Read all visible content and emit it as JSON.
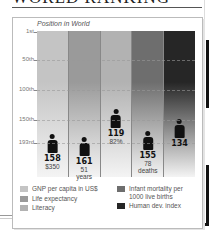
{
  "header": {
    "title": "WORLD RANKING"
  },
  "chart_data": {
    "type": "bar",
    "title": "Position in World",
    "xlabel": "",
    "ylabel": "Position in World",
    "y_ticks": [
      "1st",
      "50th",
      "100th",
      "150th",
      "193rd"
    ],
    "ylim": [
      1,
      193
    ],
    "y_inverted": true,
    "grid": true,
    "legend_position": "bottom",
    "categories": [
      "GNP per capita in US$",
      "Life expectancy",
      "Literacy",
      "Infant mortality per 1000 live births",
      "Human dev. index"
    ],
    "values": [
      158,
      161,
      119,
      155,
      134
    ],
    "annotations": [
      "$350",
      "51 years",
      "82%",
      "78 deaths",
      ""
    ],
    "colors": [
      "#c4c4c4",
      "#9a9a9a",
      "#b2b2b2",
      "#6e6e6e",
      "#262626"
    ]
  },
  "axis": {
    "labels": [
      {
        "text": "1st",
        "y": 32
      },
      {
        "text": "50th",
        "y": 60
      },
      {
        "text": "100th",
        "y": 90
      },
      {
        "text": "150th",
        "y": 120
      },
      {
        "text": "193rd",
        "y": 143
      }
    ]
  },
  "columns": [
    {
      "rank": "158",
      "sub1": "$350",
      "sub2": "",
      "top": 103,
      "color": "#c4c4c4"
    },
    {
      "rank": "161",
      "sub1": "51",
      "sub2": "years",
      "top": 106,
      "color": "#9a9a9a"
    },
    {
      "rank": "119",
      "sub1": "82%",
      "sub2": "",
      "top": 78,
      "color": "#b2b2b2"
    },
    {
      "rank": "155",
      "sub1": "78",
      "sub2": "deaths",
      "top": 100,
      "color": "#6e6e6e"
    },
    {
      "rank": "134",
      "sub1": "",
      "sub2": "",
      "top": 88,
      "color": "#262626"
    }
  ],
  "legend": {
    "left": [
      {
        "label": "GNP per capita in US$",
        "color": "#c4c4c4"
      },
      {
        "label": "Life expectancy",
        "color": "#9a9a9a"
      },
      {
        "label": "Literacy",
        "color": "#b2b2b2"
      }
    ],
    "right": [
      {
        "label": "Infant mortality per 1000 live births",
        "color": "#6e6e6e"
      },
      {
        "label": "Human dev. index",
        "color": "#262626"
      }
    ]
  }
}
